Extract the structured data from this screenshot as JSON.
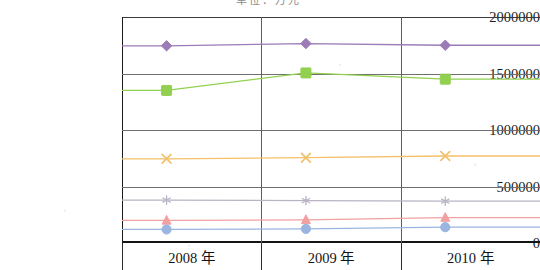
{
  "chart_data": {
    "type": "line",
    "title": "",
    "xlabel": "",
    "ylabel": "",
    "categories": [
      "2008 年",
      "2009 年",
      "2010 年"
    ],
    "ylim": [
      0,
      2000000
    ],
    "yticks": [
      0,
      500000,
      1000000,
      1500000,
      2000000
    ],
    "ytick_labels": [
      "0",
      "500000",
      "1000000",
      "1500000",
      "2000000"
    ],
    "grid": true,
    "legend": "cropped",
    "series": [
      {
        "name": "series-1-diamond-purple",
        "marker": "diamond",
        "color": "#9B7CB8",
        "values": [
          1745000,
          1765000,
          1750000
        ]
      },
      {
        "name": "series-2-square-green",
        "marker": "square",
        "color": "#92D050",
        "values": [
          1350000,
          1505000,
          1450000
        ]
      },
      {
        "name": "series-3-cross-orange",
        "marker": "cross",
        "color": "#F3C06B",
        "values": [
          745000,
          755000,
          770000
        ]
      },
      {
        "name": "series-4-asterisk-gray",
        "marker": "asterisk",
        "color": "#B9B3C4",
        "values": [
          380000,
          375000,
          370000
        ]
      },
      {
        "name": "series-5-triangle-pink",
        "marker": "triangle",
        "color": "#F2A0A0",
        "values": [
          200000,
          205000,
          225000
        ]
      },
      {
        "name": "series-6-circle-blue",
        "marker": "circle",
        "color": "#9AB6E0",
        "values": [
          120000,
          125000,
          140000
        ]
      }
    ]
  },
  "title_strip": {
    "text": "单位：万元"
  },
  "colors": {
    "axis": "#141414",
    "grid": "#6f6f6f",
    "text": "#141414",
    "background": "#ffffff"
  }
}
